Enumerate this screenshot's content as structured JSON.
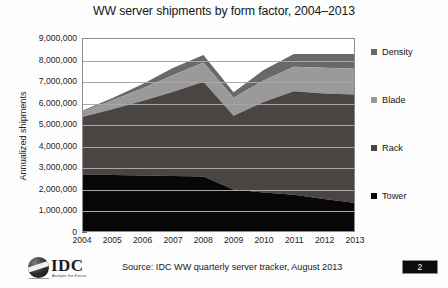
{
  "chart_data": {
    "type": "area",
    "title": "WW server shipments by form factor, 2004–2013",
    "xlabel": "",
    "ylabel": "Annualized shipments",
    "stacked": true,
    "grid": true,
    "legend_position": "right",
    "categories": [
      "2004",
      "2005",
      "2006",
      "2007",
      "2008",
      "2009",
      "2010",
      "2011",
      "2012",
      "2013"
    ],
    "ylim": [
      0,
      9000000
    ],
    "ytick_values": [
      0,
      1000000,
      2000000,
      3000000,
      4000000,
      5000000,
      6000000,
      7000000,
      8000000,
      9000000
    ],
    "ytick_labels": [
      "0",
      "1,000,000",
      "2,000,000",
      "3,000,000",
      "4,000,000",
      "5,000,000",
      "6,000,000",
      "7,000,000",
      "8,000,000",
      "9,000,000"
    ],
    "series": [
      {
        "name": "Tower",
        "color": "#070707",
        "values": [
          2650000,
          2620000,
          2600000,
          2580000,
          2550000,
          1950000,
          1800000,
          1700000,
          1500000,
          1330000
        ]
      },
      {
        "name": "Rack",
        "color": "#4a4442",
        "values": [
          2700000,
          3100000,
          3500000,
          3950000,
          4450000,
          3450000,
          4250000,
          4850000,
          4950000,
          5070000
        ]
      },
      {
        "name": "Blade",
        "color": "#9a9a9a",
        "values": [
          250000,
          420000,
          600000,
          780000,
          900000,
          850000,
          1000000,
          1150000,
          1200000,
          1200000
        ]
      },
      {
        "name": "Density",
        "color": "#696969",
        "values": [
          50000,
          110000,
          200000,
          340000,
          350000,
          250000,
          500000,
          600000,
          650000,
          700000
        ]
      }
    ],
    "totals": [
      5650000,
      6250000,
      6900000,
      7650000,
      8250000,
      6500000,
      7550000,
      8300000,
      8300000,
      8300000
    ]
  },
  "legend": {
    "items": [
      {
        "label": "Density",
        "color": "#696969"
      },
      {
        "label": "Blade",
        "color": "#9a9a9a"
      },
      {
        "label": "Rack",
        "color": "#4a4442"
      },
      {
        "label": "Tower",
        "color": "#070707"
      }
    ]
  },
  "footer": {
    "source": "Source: IDC WW quarterly server tracker, August 2013",
    "logo_word": "IDC",
    "logo_tagline": "Analyze the Future",
    "page_number": "2"
  }
}
